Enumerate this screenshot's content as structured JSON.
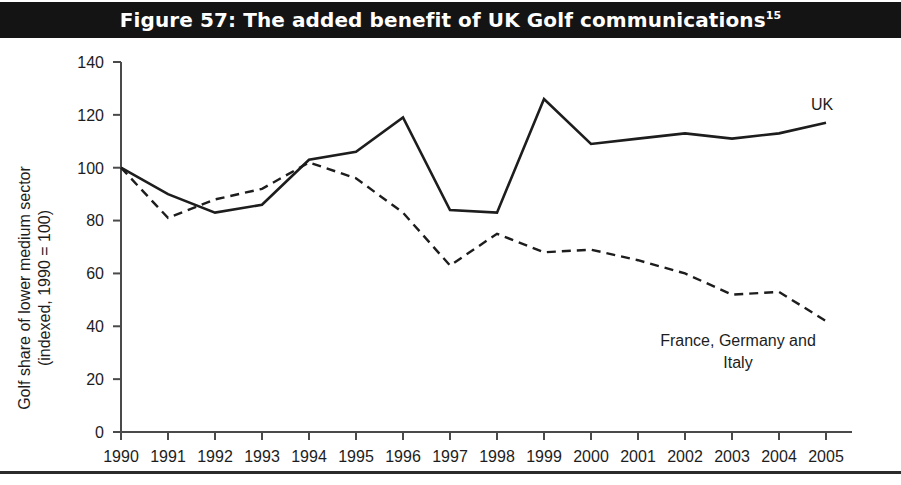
{
  "figure": {
    "title": "Figure 57: The added benefit of UK Golf communications",
    "title_superscript": "15",
    "banner_color": "#141414",
    "background_color": "#ffffff"
  },
  "chart_data": {
    "type": "line",
    "title": "",
    "xlabel": "",
    "ylabel": "Golf share of lower medium sector\n(indexed, 1990 = 100)",
    "ylabel_line1": "Golf share of lower medium sector",
    "ylabel_line2": "(indexed, 1990 = 100)",
    "categories": [
      "1990",
      "1991",
      "1992",
      "1993",
      "1994",
      "1995",
      "1996",
      "1997",
      "1998",
      "1999",
      "2000",
      "2001",
      "2002",
      "2003",
      "2004",
      "2005"
    ],
    "x": [
      1990,
      1991,
      1992,
      1993,
      1994,
      1995,
      1996,
      1997,
      1998,
      1999,
      2000,
      2001,
      2002,
      2003,
      2004,
      2005
    ],
    "ylim": [
      0,
      140
    ],
    "yticks": [
      0,
      20,
      40,
      60,
      80,
      100,
      120,
      140
    ],
    "ytick_labels": [
      "0",
      "20",
      "40",
      "60",
      "80",
      "100",
      "120",
      "140"
    ],
    "grid": false,
    "legend_position": "inline-annotation",
    "series": [
      {
        "name": "UK",
        "style": "solid",
        "color": "#1d1d1d",
        "label_text": "UK",
        "values": [
          100,
          90,
          83,
          86,
          103,
          106,
          119,
          84,
          83,
          126,
          109,
          111,
          113,
          111,
          113,
          117
        ]
      },
      {
        "name": "France, Germany and Italy",
        "style": "dashed",
        "color": "#1d1d1d",
        "label_text_line1": "France, Germany and",
        "label_text_line2": "Italy",
        "values": [
          100,
          81,
          88,
          92,
          102,
          96,
          83,
          63,
          75,
          68,
          69,
          65,
          60,
          52,
          53,
          42
        ]
      }
    ],
    "annotations": [
      {
        "text": "UK",
        "series": "UK"
      },
      {
        "text": "France, Germany and",
        "series": "France, Germany and Italy"
      },
      {
        "text": "Italy",
        "series": "France, Germany and Italy"
      }
    ]
  }
}
